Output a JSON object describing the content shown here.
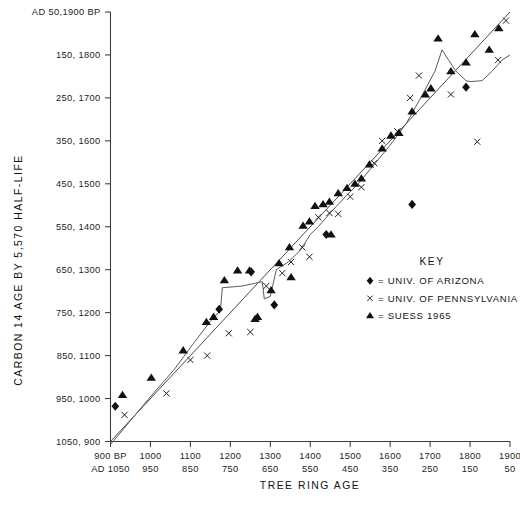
{
  "chart_data": {
    "type": "scatter",
    "title": "",
    "xlabel": "TREE RING AGE",
    "ylabel": "CARBON 14 AGE BY 5,570 HALF-LIFE",
    "grid": false,
    "legend_position": "right-middle",
    "x_axis": {
      "primary_unit": "BP",
      "secondary_unit": "AD",
      "range_bp": [
        900,
        1900
      ],
      "ticks_bp": [
        900,
        1000,
        1100,
        1200,
        1300,
        1400,
        1500,
        1600,
        1700,
        1800,
        1900
      ],
      "ticks_ad": [
        1050,
        950,
        850,
        750,
        650,
        550,
        450,
        350,
        250,
        150,
        50
      ],
      "tick_labels_bp": [
        "900 BP",
        "1000",
        "1100",
        "1200",
        "1300",
        "1400",
        "1500",
        "1600",
        "1700",
        "1800",
        "1900"
      ],
      "tick_labels_ad": [
        "AD 1050",
        "950",
        "850",
        "750",
        "650",
        "550",
        "450",
        "350",
        "250",
        "150",
        "50"
      ]
    },
    "y_axis": {
      "primary_unit": "AD",
      "secondary_unit": "BP",
      "range_bp": [
        900,
        1900
      ],
      "ticks": [
        "AD 50,1900 BP",
        "150, 1800",
        "250, 1700",
        "350, 1600",
        "450, 1500",
        "550, 1400",
        "650, 1300",
        "750, 1200",
        "850, 1100",
        "950, 1000",
        "1050, 900"
      ],
      "ticks_ad": [
        50,
        150,
        250,
        350,
        450,
        550,
        650,
        750,
        850,
        950,
        1050
      ],
      "ticks_bp": [
        1900,
        1800,
        1700,
        1600,
        1500,
        1400,
        1300,
        1200,
        1100,
        1000,
        900
      ]
    },
    "reference_line": {
      "name": "one-to-one line",
      "points_bp": [
        [
          900,
          900
        ],
        [
          1900,
          1900
        ]
      ]
    },
    "calibration_curve": {
      "name": "smoothed calibration curve",
      "points_bp": [
        [
          900,
          893
        ],
        [
          960,
          960
        ],
        [
          1010,
          1015
        ],
        [
          1060,
          1068
        ],
        [
          1105,
          1125
        ],
        [
          1150,
          1180
        ],
        [
          1175,
          1205
        ],
        [
          1180,
          1258
        ],
        [
          1230,
          1262
        ],
        [
          1260,
          1268
        ],
        [
          1280,
          1272
        ],
        [
          1285,
          1232
        ],
        [
          1300,
          1238
        ],
        [
          1315,
          1300
        ],
        [
          1345,
          1318
        ],
        [
          1375,
          1345
        ],
        [
          1400,
          1382
        ],
        [
          1420,
          1400
        ],
        [
          1450,
          1432
        ],
        [
          1490,
          1472
        ],
        [
          1520,
          1500
        ],
        [
          1560,
          1545
        ],
        [
          1600,
          1590
        ],
        [
          1640,
          1640
        ],
        [
          1680,
          1706
        ],
        [
          1712,
          1762
        ],
        [
          1730,
          1812
        ],
        [
          1745,
          1790
        ],
        [
          1765,
          1762
        ],
        [
          1790,
          1740
        ],
        [
          1800,
          1738
        ],
        [
          1830,
          1740
        ],
        [
          1855,
          1762
        ],
        [
          1880,
          1788
        ],
        [
          1900,
          1800
        ]
      ]
    },
    "series": [
      {
        "name": "UNIV. OF ARIZONA",
        "marker": "diamond",
        "key_label": "= UNIV. OF ARIZONA",
        "points_bp": [
          [
            912,
            982
          ],
          [
            1172,
            1208
          ],
          [
            1252,
            1295
          ],
          [
            1310,
            1218
          ],
          [
            1440,
            1382
          ],
          [
            1655,
            1452
          ],
          [
            1790,
            1725
          ]
        ]
      },
      {
        "name": "UNIV. OF PENNSYLVANIA",
        "marker": "x",
        "key_label": "= UNIV. OF PENNSYLVANIA",
        "points_bp": [
          [
            935,
            962
          ],
          [
            1040,
            1012
          ],
          [
            1100,
            1090
          ],
          [
            1142,
            1100
          ],
          [
            1196,
            1152
          ],
          [
            1250,
            1155
          ],
          [
            1290,
            1262
          ],
          [
            1330,
            1292
          ],
          [
            1352,
            1318
          ],
          [
            1380,
            1352
          ],
          [
            1398,
            1330
          ],
          [
            1420,
            1422
          ],
          [
            1448,
            1432
          ],
          [
            1470,
            1430
          ],
          [
            1500,
            1470
          ],
          [
            1528,
            1492
          ],
          [
            1560,
            1548
          ],
          [
            1580,
            1600
          ],
          [
            1618,
            1622
          ],
          [
            1650,
            1700
          ],
          [
            1672,
            1752
          ],
          [
            1752,
            1708
          ],
          [
            1818,
            1598
          ],
          [
            1870,
            1788
          ],
          [
            1890,
            1880
          ]
        ]
      },
      {
        "name": "SUESS 1965",
        "marker": "triangle",
        "key_label": "= SUESS 1965",
        "points_bp": [
          [
            930,
            1008
          ],
          [
            1002,
            1048
          ],
          [
            1082,
            1112
          ],
          [
            1140,
            1178
          ],
          [
            1158,
            1190
          ],
          [
            1185,
            1275
          ],
          [
            1218,
            1298
          ],
          [
            1248,
            1298
          ],
          [
            1262,
            1185
          ],
          [
            1268,
            1190
          ],
          [
            1302,
            1252
          ],
          [
            1322,
            1315
          ],
          [
            1348,
            1352
          ],
          [
            1352,
            1282
          ],
          [
            1382,
            1402
          ],
          [
            1398,
            1412
          ],
          [
            1412,
            1448
          ],
          [
            1432,
            1452
          ],
          [
            1448,
            1458
          ],
          [
            1452,
            1382
          ],
          [
            1470,
            1478
          ],
          [
            1492,
            1490
          ],
          [
            1512,
            1500
          ],
          [
            1528,
            1512
          ],
          [
            1548,
            1545
          ],
          [
            1580,
            1582
          ],
          [
            1602,
            1612
          ],
          [
            1622,
            1618
          ],
          [
            1655,
            1668
          ],
          [
            1688,
            1708
          ],
          [
            1702,
            1722
          ],
          [
            1720,
            1838
          ],
          [
            1752,
            1762
          ],
          [
            1790,
            1782
          ],
          [
            1812,
            1848
          ],
          [
            1848,
            1812
          ],
          [
            1872,
            1862
          ]
        ]
      }
    ]
  },
  "key": {
    "title": "KEY",
    "entries": [
      {
        "marker": "diamond",
        "label": "= UNIV. OF ARIZONA"
      },
      {
        "marker": "x",
        "label": "= UNIV. OF PENNSYLVANIA"
      },
      {
        "marker": "triangle",
        "label": "= SUESS 1965"
      }
    ]
  },
  "colors": {
    "ink": "#111111",
    "axis": "#3a3a3a",
    "curve": "#5a5a5a",
    "background": "#ffffff"
  }
}
